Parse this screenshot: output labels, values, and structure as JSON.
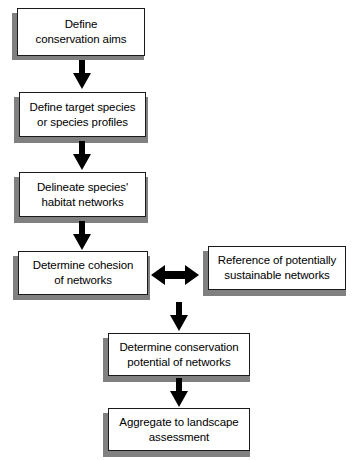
{
  "diagram": {
    "type": "flowchart",
    "title": "",
    "background_color": "#ffffff",
    "box_fill_color": "#ffffff",
    "box_border_color": "#1a1a1a",
    "shadow_color": "#808080",
    "arrow_color": "#000000",
    "nodes": [
      {
        "id": "n1",
        "label": "Define\nconservation aims"
      },
      {
        "id": "n2",
        "label": "Define target species\nor species profiles"
      },
      {
        "id": "n3",
        "label": "Delineate species'\nhabitat networks"
      },
      {
        "id": "n4",
        "label": "Determine cohesion\nof networks"
      },
      {
        "id": "n5",
        "label": "Reference of potentially\nsustainable networks"
      },
      {
        "id": "n6",
        "label": "Determine conservation\npotential of networks"
      },
      {
        "id": "n7",
        "label": "Aggregate to landscape\nassessment"
      }
    ],
    "edges": [
      {
        "from": "n1",
        "to": "n2",
        "style": "arrow-down"
      },
      {
        "from": "n2",
        "to": "n3",
        "style": "arrow-down"
      },
      {
        "from": "n3",
        "to": "n4",
        "style": "arrow-down"
      },
      {
        "from": "n4",
        "to": "n5",
        "style": "arrow-bidirectional"
      },
      {
        "from": "n4",
        "to": "n6",
        "style": "arrow-down"
      },
      {
        "from": "n6",
        "to": "n7",
        "style": "arrow-down"
      }
    ]
  }
}
